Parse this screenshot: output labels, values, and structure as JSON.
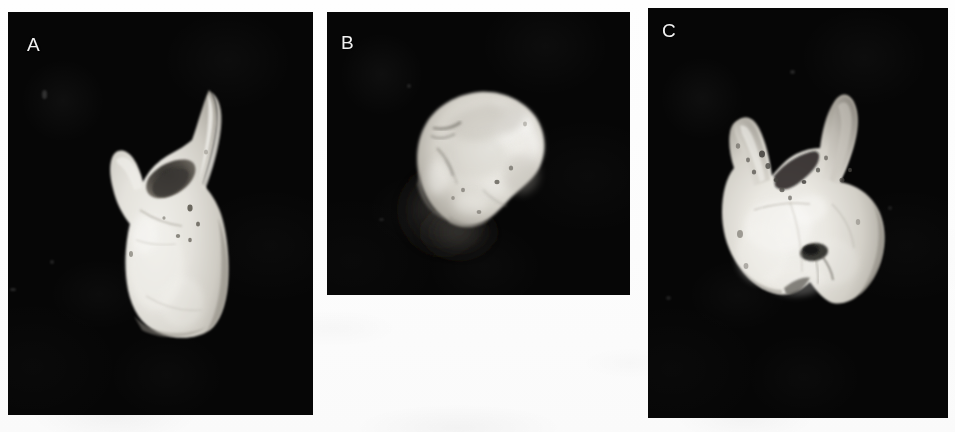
{
  "figure": {
    "type": "photographic-plate",
    "background_color": "#fdfdfd",
    "panel_background_color": "#060606",
    "label_color": "#f2f2f2",
    "specimen_color": "#e6e4df",
    "panel_count": 3,
    "panels": [
      {
        "id": "A",
        "label": "A",
        "view": "lateral view of tooth with long tapering root",
        "x": 8,
        "y": 12,
        "width": 305,
        "height": 403,
        "specimen": {
          "name": "tooth-specimen-lateral",
          "description": "pale tooth seen from the side: a long slender root tapering upward to the right, a short blunt cusp at upper left, a dark concave socket between them, and a broad rounded crown body below",
          "bbox": {
            "x": 85,
            "y": 74,
            "width": 145,
            "height": 248
          }
        }
      },
      {
        "id": "B",
        "label": "B",
        "view": "occlusal view of tooth crown",
        "x": 327,
        "y": 12,
        "width": 303,
        "height": 283,
        "specimen": {
          "name": "tooth-specimen-occlusal",
          "description": "rounded triangular crown seen from above, bright highlights on the upper right, mottled grey enamel with fissures, soft shadow falling to the lower left",
          "bbox": {
            "x": 394,
            "y": 80,
            "width": 160,
            "height": 165
          }
        }
      },
      {
        "id": "C",
        "label": "C",
        "view": "distal view of tooth with two divergent roots",
        "x": 648,
        "y": 8,
        "width": 300,
        "height": 410,
        "specimen": {
          "name": "tooth-specimen-distal",
          "description": "tooth seen from behind showing two divergent tapering roots rising in a V, speckled dark staining on the root surfaces, a wide crown body beneath with a dark pit near its centre and a notch along the lower margin",
          "bbox": {
            "x": 705,
            "y": 95,
            "width": 190,
            "height": 222
          }
        }
      }
    ]
  }
}
